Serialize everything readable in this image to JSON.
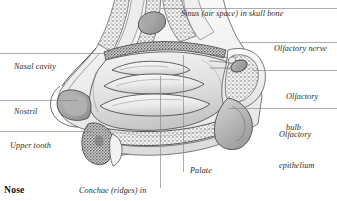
{
  "figure": {
    "caption": "Nose",
    "colors": {
      "leader_line": "#8a8a8a",
      "label_text": "#2b2b2b",
      "caption_text": "#111111",
      "background": "#ffffff",
      "tissue_light": "#ececec",
      "tissue_mid": "#cfcfcf",
      "tissue_dark": "#9a9a9a",
      "tissue_darkest": "#6b6b6b",
      "outline": "#4a4a4a"
    }
  },
  "labels": [
    {
      "id": "sinus",
      "text": "Sinus (air space) in skull bone",
      "lines": [
        "Sinus (air space) in skull bone"
      ],
      "x": 181,
      "y": 9,
      "leader": {
        "x1": 160,
        "y1": 8,
        "x2": 337,
        "y2": 8
      }
    },
    {
      "id": "olfactory-nerve",
      "text": "Olfactory nerve",
      "lines": [
        "Olfactory nerve"
      ],
      "x": 274,
      "y": 44,
      "leader": {
        "x1": 240,
        "y1": 42,
        "x2": 337,
        "y2": 42
      }
    },
    {
      "id": "olfactory-bulb",
      "text": "Olfactory bulb",
      "lines": [
        "Olfactory",
        "bulb"
      ],
      "x": 286,
      "y": 72,
      "leader": {
        "x1": 253,
        "y1": 70,
        "x2": 337,
        "y2": 70
      }
    },
    {
      "id": "olfactory-epithelium",
      "text": "Olfactory epithelium",
      "lines": [
        "Olfactory",
        "epithelium"
      ],
      "x": 279,
      "y": 110,
      "leader": {
        "x1": 228,
        "y1": 108,
        "x2": 337,
        "y2": 108
      }
    },
    {
      "id": "nasal-cavity",
      "text": "Nasal cavity",
      "lines": [
        "Nasal cavity"
      ],
      "x": 14,
      "y": 62,
      "leader": {
        "x1": 0,
        "y1": 53,
        "x2": 104,
        "y2": 53
      }
    },
    {
      "id": "nostril",
      "text": "Nostril",
      "lines": [
        "Nostril"
      ],
      "x": 14,
      "y": 107,
      "leader": {
        "x1": 0,
        "y1": 100,
        "x2": 78,
        "y2": 100
      }
    },
    {
      "id": "upper-tooth",
      "text": "Upper tooth",
      "lines": [
        "Upper tooth"
      ],
      "x": 10,
      "y": 141,
      "leader": {
        "x1": 0,
        "y1": 131,
        "x2": 92,
        "y2": 131
      }
    },
    {
      "id": "conchae",
      "text": "Conchae (ridges) in wall of nasal cavity",
      "lines": [
        "Conchae (ridges) in",
        "wall of nasal cavity"
      ],
      "x": 79,
      "y": 166,
      "leader": {
        "x1": 160,
        "y1": 76,
        "x2": 160,
        "y2": 188
      }
    },
    {
      "id": "palate",
      "text": "Palate",
      "lines": [
        "Palate"
      ],
      "x": 190,
      "y": 166,
      "leader": {
        "x1": 183,
        "y1": 55,
        "x2": 183,
        "y2": 172
      }
    }
  ],
  "illustration_parts": [
    {
      "id": "skull-bone-sinus",
      "label": "Sinus (air space) in skull bone"
    },
    {
      "id": "nasal-cavity-space",
      "label": "Nasal cavity"
    },
    {
      "id": "superior-concha",
      "label": "Superior concha"
    },
    {
      "id": "middle-concha",
      "label": "Middle concha"
    },
    {
      "id": "inferior-concha",
      "label": "Inferior concha"
    },
    {
      "id": "nostril-opening",
      "label": "Nostril"
    },
    {
      "id": "upper-tooth-root",
      "label": "Upper tooth"
    },
    {
      "id": "hard-palate",
      "label": "Palate"
    },
    {
      "id": "olfactory-bulb-mass",
      "label": "Olfactory bulb"
    },
    {
      "id": "olfactory-nerve-fibres",
      "label": "Olfactory nerve"
    },
    {
      "id": "olfactory-epithelium-lining",
      "label": "Olfactory epithelium"
    }
  ]
}
